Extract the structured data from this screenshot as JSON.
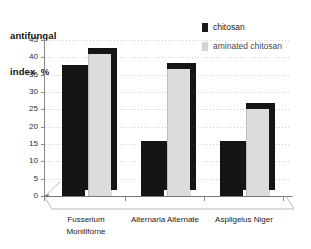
{
  "chart_data": {
    "type": "bar",
    "title": "antifungal index %",
    "title_line1": "antifungal",
    "title_line2": "index  %",
    "xlabel": "",
    "ylabel": "antifungal index %",
    "ylim": [
      0,
      45
    ],
    "ytick_step": 5,
    "yticks": [
      "45",
      "40",
      "35",
      "30",
      "25",
      "20",
      "15",
      "10",
      "5",
      "0"
    ],
    "grid": true,
    "legend_position": "top-right",
    "style": "3d-column",
    "categories": [
      "Fusserium Moniliforne",
      "Alternaria Alternate",
      "Aspllgelus Niger"
    ],
    "category_lines": [
      [
        "Fusserium",
        "Moniliforne"
      ],
      [
        "Alternaria Alternate",
        ""
      ],
      [
        "Aspllgelus Niger",
        ""
      ]
    ],
    "series": [
      {
        "name": "chitosan",
        "color": "#141414",
        "values": [
          36,
          14,
          14
        ]
      },
      {
        "name": "aminated chitosan",
        "color": "#dcdcdc",
        "values": [
          41,
          36.5,
          25
        ]
      }
    ]
  },
  "legend": {
    "items": [
      {
        "label": "chitosan",
        "swatch": "#141414"
      },
      {
        "label": "aminated chitosan",
        "swatch": "#d4d4d4"
      }
    ]
  },
  "axis": {
    "y_label_line1": "antifungal",
    "y_label_line2": "index  %"
  }
}
